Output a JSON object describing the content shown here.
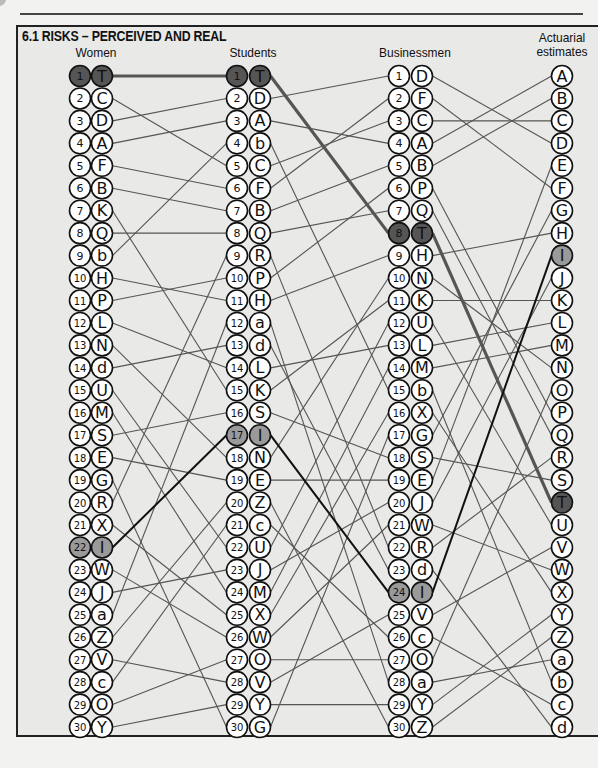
{
  "title": "6.1 RISKS – PERCEIVED AND REAL",
  "columns": [
    {
      "name": "Women",
      "numbered": true,
      "ranking": [
        "T",
        "C",
        "D",
        "A",
        "F",
        "B",
        "K",
        "Q",
        "b",
        "H",
        "P",
        "L",
        "N",
        "d",
        "U",
        "M",
        "S",
        "E",
        "G",
        "R",
        "X",
        "I",
        "W",
        "J",
        "a",
        "Z",
        "V",
        "c",
        "O",
        "Y"
      ]
    },
    {
      "name": "Students",
      "numbered": true,
      "ranking": [
        "T",
        "D",
        "A",
        "b",
        "C",
        "F",
        "B",
        "Q",
        "R",
        "P",
        "H",
        "a",
        "d",
        "L",
        "K",
        "S",
        "I",
        "N",
        "E",
        "Z",
        "c",
        "U",
        "J",
        "M",
        "X",
        "W",
        "O",
        "V",
        "Y",
        "G"
      ]
    },
    {
      "name": "Businessmen",
      "numbered": true,
      "ranking": [
        "D",
        "F",
        "C",
        "A",
        "B",
        "P",
        "Q",
        "T",
        "H",
        "N",
        "K",
        "U",
        "L",
        "M",
        "b",
        "X",
        "G",
        "S",
        "E",
        "J",
        "W",
        "R",
        "d",
        "I",
        "V",
        "c",
        "O",
        "a",
        "Y",
        "Z"
      ]
    },
    {
      "name": "Actuarial estimates",
      "numbered": false,
      "ranking": [
        "A",
        "B",
        "C",
        "D",
        "E",
        "F",
        "G",
        "H",
        "I",
        "J",
        "K",
        "L",
        "M",
        "N",
        "O",
        "P",
        "Q",
        "R",
        "S",
        "T",
        "U",
        "V",
        "W",
        "X",
        "Y",
        "Z",
        "a",
        "b",
        "c",
        "d"
      ]
    }
  ],
  "highlights": [
    {
      "item": "T",
      "style": "dark",
      "color": "#555555"
    },
    {
      "item": "I",
      "style": "light",
      "color": "#9a9a9a"
    }
  ],
  "chart_data": {
    "type": "rank-comparison",
    "title": "6.1 RISKS – PERCEIVED AND REAL",
    "groups": [
      "Women",
      "Students",
      "Businessmen",
      "Actuarial estimates"
    ],
    "highlighted_items": [
      "T",
      "I"
    ]
  }
}
